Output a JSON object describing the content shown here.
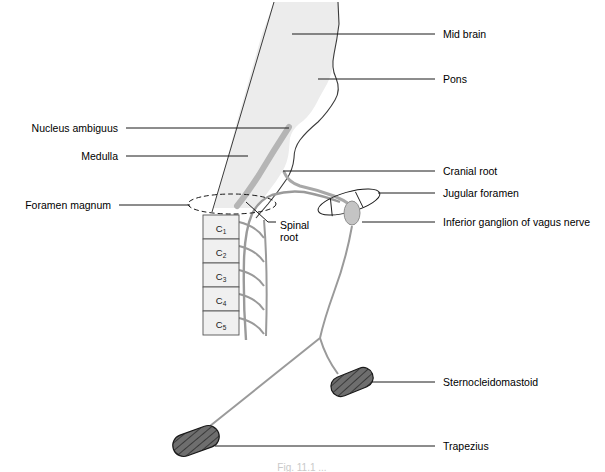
{
  "figure": {
    "caption_partial": "Fig. 11.1 ...",
    "colors": {
      "line": "#1a1a1a",
      "brainstem_fill": "#ececec",
      "brainstem_stroke": "#3a3a3a",
      "nerve_grey": "#b5b5b5",
      "nerve_dark": "#8c8c8c",
      "vertebra_fill": "#f0f0f0",
      "muscle_fill": "#6e6e6e",
      "muscle_stroke": "#1a1a1a",
      "ganglion_fill": "#c0c0c0",
      "background": "#ffffff"
    }
  },
  "labels_left": [
    {
      "id": "nucleus-ambiguus",
      "text": "Nucleus ambiguus",
      "text_x": 118,
      "text_y": 132,
      "line_x1": 126,
      "line_x2": 289,
      "line_y": 128
    },
    {
      "id": "medulla",
      "text": "Medulla",
      "text_x": 118,
      "text_y": 160,
      "line_x1": 126,
      "line_x2": 248,
      "line_y": 156
    },
    {
      "id": "foramen-magnum",
      "text": "Foramen magnum",
      "text_x": 111,
      "text_y": 209,
      "line_x1": 119,
      "line_x2": 190,
      "line_y": 205
    }
  ],
  "labels_right": [
    {
      "id": "mid-brain",
      "text": "Mid brain",
      "text_x": 443,
      "text_y": 38,
      "line_x1": 292,
      "line_x2": 435,
      "line_y": 34
    },
    {
      "id": "pons",
      "text": "Pons",
      "text_x": 443,
      "text_y": 83,
      "line_x1": 318,
      "line_x2": 435,
      "line_y": 79
    },
    {
      "id": "cranial-root",
      "text": "Cranial root",
      "text_x": 443,
      "text_y": 175,
      "line_x1": 283,
      "line_x2": 435,
      "line_y": 171
    },
    {
      "id": "jugular-foramen",
      "text": "Jugular foramen",
      "text_x": 443,
      "text_y": 197,
      "line_x1": 378,
      "line_x2": 435,
      "line_y": 193
    },
    {
      "id": "inferior-ganglion",
      "text": "Inferior ganglion of vagus nerve",
      "text_x": 443,
      "text_y": 226,
      "line_x1": 362,
      "line_x2": 435,
      "line_y": 222
    },
    {
      "id": "sternocleidomastoid",
      "text": "Sternocleidomastoid",
      "text_x": 443,
      "text_y": 386,
      "line_x1": 372,
      "line_x2": 435,
      "line_y": 382
    },
    {
      "id": "trapezius",
      "text": "Trapezius",
      "text_x": 443,
      "text_y": 450,
      "line_x1": 215,
      "line_x2": 435,
      "line_y": 446
    }
  ],
  "label_inner": {
    "id": "spinal-root",
    "line1": "Spinal",
    "line2": "root",
    "text_x": 277,
    "text_y1": 226,
    "text_y2": 238,
    "leader_points": "246,202 268,222 276,222"
  },
  "vertebrae": [
    {
      "label": "C",
      "sub": "1",
      "x": 203,
      "y": 215,
      "w": 36,
      "h": 24
    },
    {
      "label": "C",
      "sub": "2",
      "x": 203,
      "y": 239,
      "w": 36,
      "h": 24
    },
    {
      "label": "C",
      "sub": "3",
      "x": 203,
      "y": 263,
      "w": 36,
      "h": 24
    },
    {
      "label": "C",
      "sub": "4",
      "x": 203,
      "y": 287,
      "w": 36,
      "h": 24
    },
    {
      "label": "C",
      "sub": "5",
      "x": 203,
      "y": 311,
      "w": 36,
      "h": 24
    }
  ],
  "muscles": [
    {
      "id": "sternocleidomastoid-muscle",
      "cx": 352,
      "cy": 382,
      "rx": 22,
      "ry": 10,
      "rotate": -22
    },
    {
      "id": "trapezius-muscle",
      "cx": 196,
      "cy": 441,
      "rx": 24,
      "ry": 11,
      "rotate": -20
    }
  ],
  "structures": {
    "foramen_magnum_ellipse": {
      "cx": 232,
      "cy": 204,
      "rx": 44,
      "ry": 10
    },
    "jugular_foramen": {
      "cx": 349,
      "cy": 202,
      "rx": 32,
      "ry": 10,
      "rotate": -16
    },
    "inferior_ganglion": {
      "cx": 352,
      "cy": 213,
      "rx": 8,
      "ry": 12
    }
  }
}
